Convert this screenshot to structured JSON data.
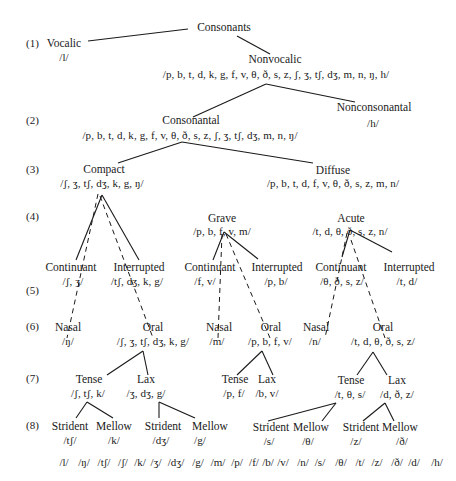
{
  "levels": [
    "(1)",
    "(2)",
    "(3)",
    "(4)",
    "(5)",
    "(6)",
    "(7)",
    "(8)"
  ],
  "nodes": {
    "consonants": {
      "label": "Consonants"
    },
    "vocalic": {
      "label": "Vocalic",
      "phonemes": "/l/"
    },
    "nonvocalic": {
      "label": "Nonvocalic",
      "phonemes": "/p, b, t, d, k, g, f, v, θ, ð, s, z, ʃ, ʒ, tʃ, dʒ, m, n, ŋ, h/"
    },
    "consonantal": {
      "label": "Consonantal",
      "phonemes": "/p, b, t, d, k, g, f, v, θ, ð, s, z, ʃ, ʒ, tʃ, dʒ, m, n, ŋ/"
    },
    "nonconsonantal": {
      "label": "Nonconsonantal",
      "phonemes": "/h/"
    },
    "compact": {
      "label": "Compact",
      "phonemes": "/ʃ, ʒ, tʃ, dʒ, k, g, ŋ/"
    },
    "diffuse": {
      "label": "Diffuse",
      "phonemes": "/p, b, t, d, f, v, θ, ð, s, z, m, n/"
    },
    "grave": {
      "label": "Grave",
      "phonemes": "/p, b, f, v, m/"
    },
    "acute": {
      "label": "Acute",
      "phonemes": "/t, d, θ, ð, s, z, n/"
    },
    "compact_continuant": {
      "label": "Continuant",
      "phonemes": "/ʃ, ʒ/"
    },
    "compact_interrupted": {
      "label": "Interrupted",
      "phonemes": "/tʃ, dʒ, k, g/"
    },
    "grave_continuant": {
      "label": "Continuant",
      "phonemes": "/f, v/"
    },
    "grave_interrupted": {
      "label": "Interrupted",
      "phonemes": "/p, b/"
    },
    "acute_continuant": {
      "label": "Continuant",
      "phonemes": "/θ, ð, s, z/"
    },
    "acute_interrupted": {
      "label": "Interrupted",
      "phonemes": "/t, d/"
    },
    "compact_nasal": {
      "label": "Nasal",
      "phonemes": "/ŋ/"
    },
    "compact_oral": {
      "label": "Oral",
      "phonemes": "/ʃ, ʒ, tʃ, dʒ, k, g/"
    },
    "grave_nasal": {
      "label": "Nasal",
      "phonemes": "/m/"
    },
    "grave_oral": {
      "label": "Oral",
      "phonemes": "/p, b, f, v/"
    },
    "acute_nasal": {
      "label": "Nasal",
      "phonemes": "/n/"
    },
    "acute_oral": {
      "label": "Oral",
      "phonemes": "/t, d, θ, ð, s, z/"
    },
    "compact_tense": {
      "label": "Tense",
      "phonemes": "/ʃ, tʃ, k/"
    },
    "compact_lax": {
      "label": "Lax",
      "phonemes": "/ʒ, dʒ, g/"
    },
    "grave_tense": {
      "label": "Tense",
      "phonemes": "/p, f/"
    },
    "grave_lax": {
      "label": "Lax",
      "phonemes": "/b, v/"
    },
    "acute_tense": {
      "label": "Tense",
      "phonemes": "/t, θ, s/"
    },
    "acute_lax": {
      "label": "Lax",
      "phonemes": "/d, ð, z/"
    },
    "ct_strident": {
      "label": "Strident",
      "phonemes": "/tʃ/"
    },
    "ct_mellow": {
      "label": "Mellow",
      "phonemes": "/k/"
    },
    "cl_strident": {
      "label": "Strident",
      "phonemes": "/dʒ/"
    },
    "cl_mellow": {
      "label": "Mellow",
      "phonemes": "/g/"
    },
    "at_strident": {
      "label": "Strident",
      "phonemes": "/s/"
    },
    "at_mellow": {
      "label": "Mellow",
      "phonemes": "/θ/"
    },
    "al_strident": {
      "label": "Strident",
      "phonemes": "/z/"
    },
    "al_mellow": {
      "label": "Mellow",
      "phonemes": "/ð/"
    }
  },
  "terminal_row": [
    "/l/",
    "/ŋ/",
    "/tʃ/",
    "/ʃ/",
    "/k/",
    "/ʒ/",
    "/dʒ/",
    "/g/",
    "/m/",
    "/p/",
    "/f/",
    "/b/",
    "/v/",
    "/n/",
    "/s/",
    "/θ/",
    "/t/",
    "/z/",
    "/ð/",
    "/d/",
    "/h/"
  ]
}
